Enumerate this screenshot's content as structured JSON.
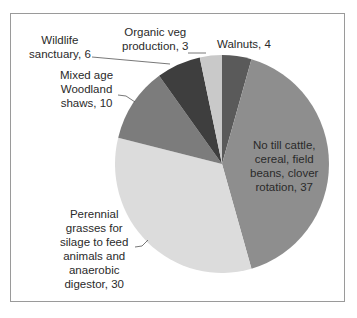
{
  "chart_data": {
    "type": "pie",
    "title": "",
    "start_angle_deg": 0,
    "direction": "clockwise",
    "slices": [
      {
        "label": "Walnuts",
        "value": 4,
        "color": "#5a5a5a",
        "label_lines": [
          "Walnuts, 4"
        ]
      },
      {
        "label": "No till cattle, cereal, field beans, clover rotation",
        "value": 37,
        "color": "#8e8e8e",
        "label_lines": [
          "No till cattle,",
          "cereal, field",
          "beans, clover",
          "rotation, 37"
        ]
      },
      {
        "label": "Perennial grasses for silage to feed animals and anaerobic digestor",
        "value": 30,
        "color": "#dcdcdc",
        "label_lines": [
          "Perennial",
          "grasses for",
          "silage to feed",
          "animals and",
          "anaerobic",
          "digestor, 30"
        ]
      },
      {
        "label": "Mixed age Woodland shaws",
        "value": 10,
        "color": "#7c7c7c",
        "label_lines": [
          "Mixed age",
          "Woodland",
          "shaws, 10"
        ]
      },
      {
        "label": "Wildlife sanctuary",
        "value": 6,
        "color": "#3e3e3e",
        "label_lines": [
          "Wildlife",
          "sanctuary, 6"
        ]
      },
      {
        "label": "Organic veg production",
        "value": 3,
        "color": "#c9c9c9",
        "label_lines": [
          "Organic veg",
          "production, 3"
        ]
      }
    ],
    "legend": "none (data labels with leader lines)"
  }
}
